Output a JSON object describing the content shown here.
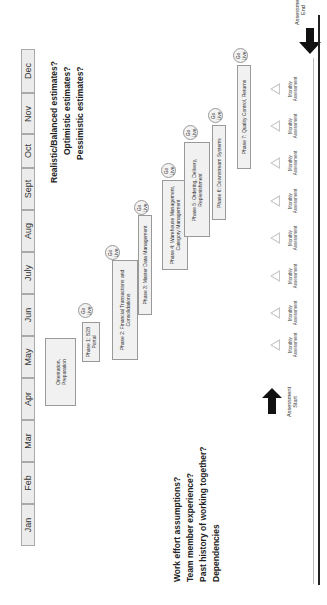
{
  "timeline": {
    "months": [
      "Jan",
      "Feb",
      "Mar",
      "Apr",
      "May",
      "Jun",
      "July",
      "Aug",
      "Sept",
      "Oct",
      "Nov",
      "Dec"
    ]
  },
  "phases": [
    {
      "label": "Orientation,\nPreparation",
      "go_live": false
    },
    {
      "label": "Phase 1: B2B\nPortal",
      "go_live": true
    },
    {
      "label": "Phase 2: Financial Transactions and\nConsolidations",
      "go_live": true
    },
    {
      "label": "Phase 3: Master Data Management",
      "go_live": true
    },
    {
      "label": "Phase 4: Warehouse Management,\nCategory Management",
      "go_live": true
    },
    {
      "label": "Phase 5: Ordering, Delivery,\nReplenishment",
      "go_live": true
    },
    {
      "label": "Phase 6: Downstream Systems",
      "go_live": true
    },
    {
      "label": "Phase 7: Quality Control, Returns",
      "go_live": true
    }
  ],
  "go_live_label": "Go\nLive",
  "questions_top": [
    "Realistic/Balanced estimates?",
    "Optimistic estimates?",
    "Pessimistic estimates?"
  ],
  "questions_bottom": [
    "Work effort assumptions?",
    "Team member experience?",
    "Past history of working together?",
    "Dependencies"
  ],
  "assessments": {
    "start_label": "Assessment\nStart",
    "end_label": "Assessment\nEnd",
    "monthly_label": "Monthly\nAssessment",
    "monthly_count": 8
  }
}
